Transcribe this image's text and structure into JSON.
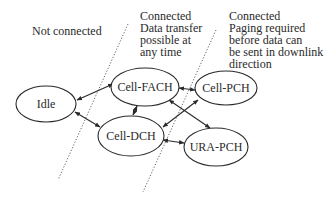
{
  "regions": [
    {
      "id": "not-connected",
      "lines": [
        "Not connected"
      ]
    },
    {
      "id": "connected-dch-fach",
      "lines": [
        "Connected",
        "Data transfer",
        "possible at",
        "any time"
      ]
    },
    {
      "id": "connected-pch",
      "lines": [
        "Connected",
        "Paging required",
        "before data can",
        "be sent in downlink",
        "direction"
      ]
    }
  ],
  "states": {
    "idle": "Idle",
    "cell_fach": "Cell-FACH",
    "cell_dch": "Cell-DCH",
    "cell_pch": "Cell-PCH",
    "ura_pch": "URA-PCH"
  },
  "transitions": [
    {
      "from": "Idle",
      "to": "Cell-FACH",
      "bidirectional": true
    },
    {
      "from": "Idle",
      "to": "Cell-DCH",
      "bidirectional": true
    },
    {
      "from": "Cell-FACH",
      "to": "Cell-DCH",
      "bidirectional": true
    },
    {
      "from": "Cell-FACH",
      "to": "Cell-PCH",
      "bidirectional": true
    },
    {
      "from": "Cell-FACH",
      "to": "URA-PCH",
      "bidirectional": true
    },
    {
      "from": "Cell-DCH",
      "to": "Cell-PCH",
      "bidirectional": true
    },
    {
      "from": "Cell-DCH",
      "to": "URA-PCH",
      "bidirectional": true
    }
  ],
  "colors": {
    "line": "#2a2a2a",
    "divider": "#555555",
    "background": "#ffffff"
  }
}
